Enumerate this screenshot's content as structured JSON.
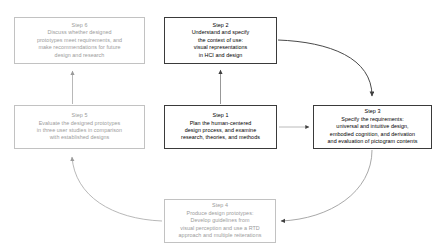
{
  "diagram": {
    "colors": {
      "active_border": "#3a3a3a",
      "active_text": "#000000",
      "muted_border": "#c2c2c2",
      "muted_text": "#9b9b9b",
      "arrow_dark": "#4a4a4a",
      "arrow_light": "#b5b5b5",
      "background": "#ffffff"
    },
    "nodes": [
      {
        "id": "step1",
        "title": "Step 1",
        "lines": [
          "Plan the human-centered",
          "design process, and examine",
          "research, theories, and methods"
        ],
        "emphasis": "active"
      },
      {
        "id": "step2",
        "title": "Step 2",
        "lines": [
          "Understand and specify",
          "the context of use:",
          "visual representations",
          "in HCI and design"
        ],
        "emphasis": "active"
      },
      {
        "id": "step3",
        "title": "Step 3",
        "lines": [
          "Specify the requirements:",
          "universal and intuitive design,",
          "embodied cognition, and derivation",
          "and evaluation of pictogram contents"
        ],
        "emphasis": "active"
      },
      {
        "id": "step4",
        "title": "Step 4",
        "lines": [
          "Produce design prototypes:",
          "Develop guidelines from",
          "visual perception and use a RTD",
          "approach and multiple reiterations"
        ],
        "emphasis": "muted"
      },
      {
        "id": "step5",
        "title": "Step 5",
        "lines": [
          "Evaluate the designed prototypes",
          "in three user studies in comparison",
          "with established designs"
        ],
        "emphasis": "muted"
      },
      {
        "id": "step6",
        "title": "Step 6",
        "lines": [
          "Discuss whether designed",
          "prototypes meet requirements, and",
          "make recommendations for future",
          "design and research"
        ],
        "emphasis": "muted"
      }
    ],
    "connectors": [
      {
        "id": "step1-to-step2",
        "from": "step1",
        "to": "step2",
        "style": "straight-up"
      },
      {
        "id": "step1-to-step3",
        "from": "step1",
        "to": "step3",
        "style": "straight-right"
      },
      {
        "id": "step2-to-step3",
        "from": "step2",
        "to": "step3",
        "style": "curve-clockwise"
      },
      {
        "id": "step3-to-step4",
        "from": "step3",
        "to": "step4",
        "style": "curve-clockwise"
      },
      {
        "id": "step4-to-step5",
        "from": "step4",
        "to": "step5",
        "style": "curve-clockwise"
      },
      {
        "id": "step5-to-step6",
        "from": "step5",
        "to": "step6",
        "style": "straight-up"
      }
    ]
  }
}
